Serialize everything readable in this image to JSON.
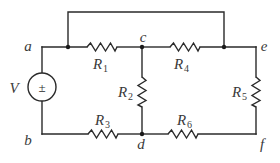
{
  "diagram": {
    "type": "electrical circuit schematic",
    "source": {
      "label": "V",
      "symbol": "±",
      "between_nodes": [
        "a",
        "b"
      ]
    },
    "nodes": [
      {
        "id": "a",
        "label": "a"
      },
      {
        "id": "b",
        "label": "b"
      },
      {
        "id": "c",
        "label": "c"
      },
      {
        "id": "d",
        "label": "d"
      },
      {
        "id": "e",
        "label": "e"
      },
      {
        "id": "f",
        "label": "f"
      }
    ],
    "resistors": [
      {
        "id": "R1",
        "label": "R",
        "sub": "1",
        "between": [
          "a",
          "c"
        ]
      },
      {
        "id": "R2",
        "label": "R",
        "sub": "2",
        "between": [
          "c",
          "d"
        ]
      },
      {
        "id": "R3",
        "label": "R",
        "sub": "3",
        "between": [
          "b",
          "d"
        ]
      },
      {
        "id": "R4",
        "label": "R",
        "sub": "4",
        "between": [
          "c",
          "e"
        ]
      },
      {
        "id": "R5",
        "label": "R",
        "sub": "5",
        "between": [
          "e",
          "f"
        ]
      },
      {
        "id": "R6",
        "label": "R",
        "sub": "6",
        "between": [
          "d",
          "f"
        ]
      }
    ],
    "bypass_wire": {
      "between": [
        "a",
        "e"
      ],
      "note": "short across R1 and R4"
    }
  }
}
